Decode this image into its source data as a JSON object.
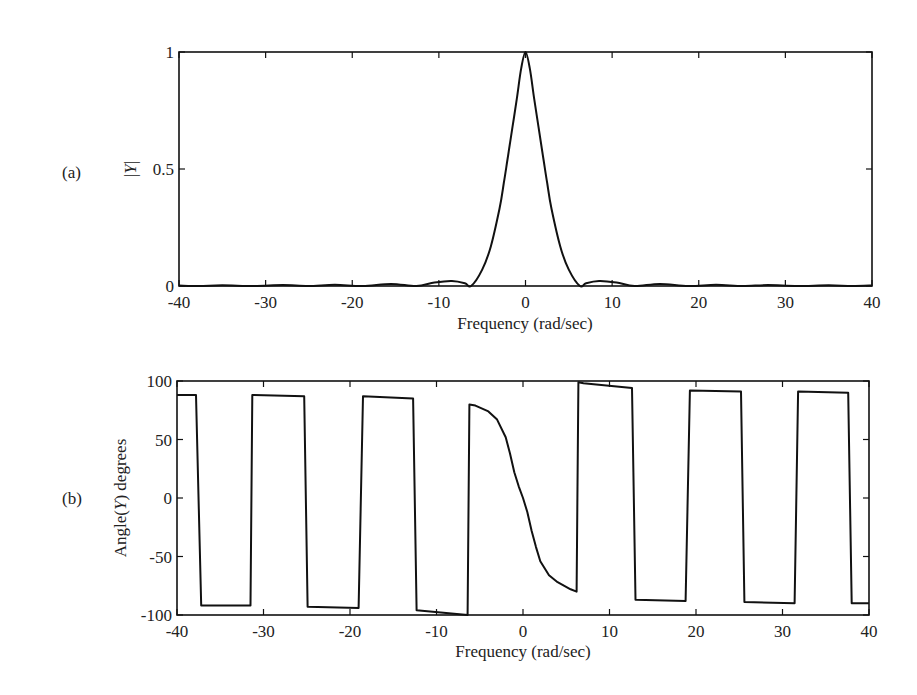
{
  "chart_data": [
    {
      "panel_label": "(a)",
      "type": "line",
      "title": "",
      "xlabel": "Frequency (rad/sec)",
      "ylabel": "|Y|",
      "xlim": [
        -40,
        40
      ],
      "ylim": [
        0,
        1
      ],
      "grid": false,
      "legend": null,
      "xticks": [
        -40,
        -30,
        -20,
        -10,
        0,
        10,
        20,
        30,
        40
      ],
      "xtick_labels": [
        "-40",
        "-30",
        "-20",
        "-10",
        "0",
        "10",
        "20",
        "30",
        "40"
      ],
      "yticks": [
        0,
        0.5,
        1
      ],
      "ytick_labels": [
        "0",
        "0.5",
        "1"
      ],
      "series": [
        {
          "name": "|Y|",
          "x": [
            -40,
            -37.7,
            -35,
            -31.4,
            -28,
            -25.1,
            -22,
            -18.8,
            -15.5,
            -12.6,
            -10.5,
            -8.5,
            -7,
            -6.28,
            -5,
            -4,
            -3,
            -2.5,
            -2,
            -1.5,
            -1,
            -0.5,
            0,
            0.5,
            1,
            1.5,
            2,
            2.5,
            3,
            4,
            5,
            6.28,
            7,
            8.5,
            10.5,
            12.6,
            15.5,
            18.8,
            22,
            25.1,
            28,
            31.4,
            35,
            37.7,
            40
          ],
          "y": [
            0.002,
            0,
            0.003,
            0,
            0.004,
            0,
            0.005,
            0,
            0.009,
            0,
            0.015,
            0.022,
            0.012,
            0,
            0.07,
            0.17,
            0.33,
            0.44,
            0.56,
            0.68,
            0.8,
            0.93,
            1.0,
            0.93,
            0.8,
            0.68,
            0.56,
            0.44,
            0.33,
            0.17,
            0.07,
            0,
            0.012,
            0.022,
            0.015,
            0,
            0.009,
            0,
            0.005,
            0,
            0.004,
            0,
            0.003,
            0,
            0.002
          ]
        }
      ]
    },
    {
      "panel_label": "(b)",
      "type": "line",
      "title": "",
      "xlabel": "Frequency (rad/sec)",
      "ylabel": "Angle(Y) degrees",
      "xlim": [
        -40,
        40
      ],
      "ylim": [
        -100,
        100
      ],
      "grid": false,
      "legend": null,
      "xticks": [
        -40,
        -30,
        -20,
        -10,
        0,
        10,
        20,
        30,
        40
      ],
      "xtick_labels": [
        "-40",
        "-30",
        "-20",
        "-10",
        "0",
        "10",
        "20",
        "30",
        "40"
      ],
      "yticks": [
        -100,
        -50,
        0,
        50,
        100
      ],
      "ytick_labels": [
        "-100",
        "-50",
        "0",
        "50",
        "100"
      ],
      "series": [
        {
          "name": "Angle(Y)",
          "x": [
            -40,
            -37.8,
            -37.2,
            -31.5,
            -31.3,
            -25.3,
            -24.9,
            -19.0,
            -18.5,
            -12.7,
            -12.3,
            -6.4,
            -6.2,
            -5.5,
            -4,
            -3,
            -2,
            -1.5,
            -1,
            -0.5,
            0,
            0.5,
            1,
            1.5,
            2,
            3,
            4,
            5.5,
            6.2,
            6.4,
            7.0,
            12.6,
            13.0,
            18.8,
            19.3,
            25.2,
            25.6,
            31.4,
            31.8,
            37.6,
            38.0,
            40
          ],
          "y": [
            88,
            88,
            -92,
            -92,
            88,
            87,
            -93,
            -94,
            87,
            85,
            -96,
            -100,
            80,
            79,
            74,
            67,
            52,
            38,
            22,
            10,
            0,
            -12,
            -28,
            -42,
            -54,
            -66,
            -72,
            -78,
            -80,
            99,
            98,
            94,
            -87,
            -88,
            92,
            91,
            -89,
            -90,
            91,
            90,
            -90,
            -90
          ]
        }
      ]
    }
  ],
  "panels": {
    "a": {
      "label": "(a)",
      "ylabel_prefix": "|",
      "ylabel_var": "Y",
      "ylabel_suffix": "|",
      "xlabel": "Frequency (rad/sec)"
    },
    "b": {
      "label": "(b)",
      "ylabel_pre": "Angle(",
      "ylabel_var": "Y",
      "ylabel_post": ") degrees",
      "xlabel": "Frequency (rad/sec)"
    }
  }
}
